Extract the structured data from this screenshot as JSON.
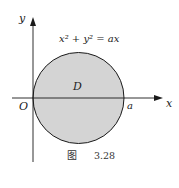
{
  "figure": {
    "equation": "x² + y² = ax",
    "region_label": "D",
    "origin_label": "O",
    "point_label": "a",
    "x_axis_label": "x",
    "y_axis_label": "y",
    "caption_prefix": "图",
    "caption_number": "3.28",
    "fill_color": "#d4d4d4",
    "stroke_color": "#1a1a1a"
  }
}
